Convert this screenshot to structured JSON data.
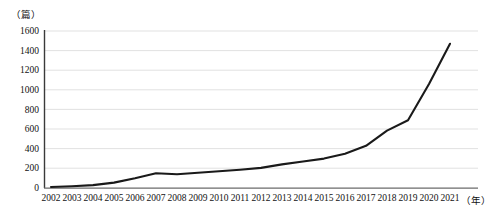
{
  "chart_data": {
    "type": "line",
    "title": "",
    "subtitle": "",
    "xlabel": "（年）",
    "ylabel": "（篇）",
    "x": [
      2002,
      2003,
      2004,
      2005,
      2006,
      2007,
      2008,
      2009,
      2010,
      2011,
      2012,
      2013,
      2014,
      2015,
      2016,
      2017,
      2018,
      2019,
      2020,
      2021
    ],
    "categories": [
      "2002",
      "2003",
      "2004",
      "2005",
      "2006",
      "2007",
      "2008",
      "2009",
      "2010",
      "2011",
      "2012",
      "2013",
      "2014",
      "2015",
      "2016",
      "2017",
      "2018",
      "2019",
      "2020",
      "2021"
    ],
    "values": [
      10,
      18,
      30,
      55,
      100,
      150,
      140,
      155,
      170,
      185,
      205,
      240,
      270,
      300,
      350,
      430,
      585,
      690,
      1060,
      1470
    ],
    "series": [
      {
        "name": "发文量",
        "values": [
          10,
          18,
          30,
          55,
          100,
          150,
          140,
          155,
          170,
          185,
          205,
          240,
          270,
          300,
          350,
          430,
          585,
          690,
          1060,
          1470
        ]
      }
    ],
    "ylim": [
      0,
      1600
    ],
    "yticks": [
      0,
      200,
      400,
      600,
      800,
      1000,
      1200,
      1400,
      1600
    ],
    "ytick_labels": [
      "0",
      "200",
      "400",
      "600",
      "800",
      "1000",
      "1200",
      "1400",
      "1600"
    ],
    "xtick_labels": [
      "2002",
      "2003",
      "2004",
      "2005",
      "2006",
      "2007",
      "2008",
      "2009",
      "2010",
      "2011",
      "2012",
      "2013",
      "2014",
      "2015",
      "2016",
      "2017",
      "2018",
      "2019",
      "2020",
      "2021"
    ],
    "grid": true,
    "grid_axis": "y",
    "legend": false,
    "legend_position": "none",
    "line_color": "#1a1a1a",
    "grid_color": "#d9d9d9",
    "axis_color": "#555555",
    "background": "#ffffff"
  }
}
